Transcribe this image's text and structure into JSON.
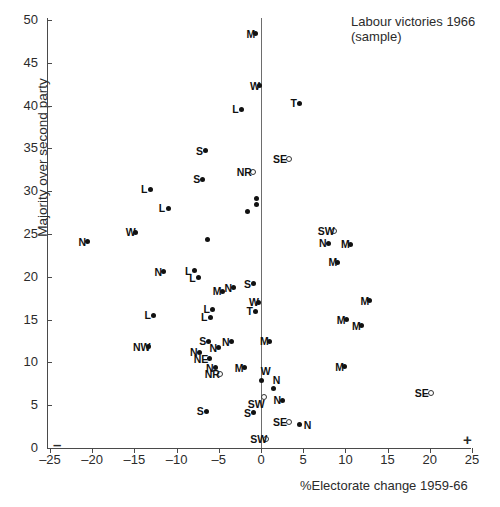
{
  "title": "Figure 8.2  Labour victories at the 1966 General Election",
  "legend": [
    "Labour victories 1966",
    "(sample)"
  ],
  "axes": {
    "ylabel": "Majority over second party",
    "xlabel": "%Electorate change 1959-66",
    "yticks": [
      0,
      5,
      10,
      15,
      20,
      25,
      30,
      35,
      40,
      45,
      50
    ],
    "xticks": [
      -25,
      -20,
      -15,
      -10,
      -5,
      0,
      5,
      10,
      15,
      20,
      25
    ],
    "xtick_labels": [
      "–25",
      "–20",
      "–15",
      "–10",
      "–5",
      "0",
      "5",
      "10",
      "15",
      "20",
      "25"
    ],
    "xlim": [
      -25,
      25
    ],
    "ylim": [
      0,
      50
    ],
    "negative_sign": "–",
    "positive_sign": "+",
    "grid": false
  },
  "chart_data": {
    "type": "scatter",
    "title": "Figure 8.2  Labour victories at the 1966 General Election",
    "xlabel": "%Electorate change 1959-66",
    "ylabel": "Majority over second party",
    "xlim": [
      -25,
      25
    ],
    "ylim": [
      0,
      50
    ],
    "grid": false,
    "legend": [
      "Labour victories 1966 (sample)"
    ],
    "legend_position": "top-right",
    "marker_styles": {
      "filled": "solid black dot",
      "open": "hollow circle"
    },
    "points": [
      {
        "label": "M",
        "x": -0.6,
        "y": 48.4,
        "marker": "filled",
        "label_pos": "left"
      },
      {
        "label": "W",
        "x": -0.2,
        "y": 42.3,
        "marker": "filled",
        "label_pos": "left"
      },
      {
        "label": "T",
        "x": 4.6,
        "y": 40.3,
        "marker": "filled",
        "label_pos": "left"
      },
      {
        "label": "L",
        "x": -2.3,
        "y": 39.6,
        "marker": "filled",
        "label_pos": "left"
      },
      {
        "label": "S",
        "x": -6.6,
        "y": 34.7,
        "marker": "filled",
        "label_pos": "left"
      },
      {
        "label": "SE",
        "x": 3.3,
        "y": 33.8,
        "marker": "open",
        "label_pos": "left"
      },
      {
        "label": "NR",
        "x": -1.0,
        "y": 32.3,
        "marker": "open",
        "label_pos": "left"
      },
      {
        "label": "S",
        "x": -6.9,
        "y": 31.4,
        "marker": "filled",
        "label_pos": "left"
      },
      {
        "label": "L",
        "x": -13.1,
        "y": 30.2,
        "marker": "filled",
        "label_pos": "left"
      },
      {
        "label": "",
        "x": -0.5,
        "y": 29.1,
        "marker": "filled",
        "label_pos": "none"
      },
      {
        "label": "",
        "x": -0.5,
        "y": 28.4,
        "marker": "filled",
        "label_pos": "none"
      },
      {
        "label": "L",
        "x": -11.0,
        "y": 28.0,
        "marker": "filled",
        "label_pos": "left"
      },
      {
        "label": "",
        "x": -1.6,
        "y": 27.6,
        "marker": "filled",
        "label_pos": "none"
      },
      {
        "label": "SW",
        "x": 8.6,
        "y": 25.3,
        "marker": "open",
        "label_pos": "left"
      },
      {
        "label": "W",
        "x": -14.9,
        "y": 25.2,
        "marker": "filled",
        "label_pos": "left"
      },
      {
        "label": "N",
        "x": -20.5,
        "y": 24.1,
        "marker": "filled",
        "label_pos": "left"
      },
      {
        "label": "N",
        "x": 8.0,
        "y": 23.9,
        "marker": "filled",
        "label_pos": "left"
      },
      {
        "label": "M",
        "x": 10.6,
        "y": 23.8,
        "marker": "filled",
        "label_pos": "left"
      },
      {
        "label": "",
        "x": -6.3,
        "y": 24.4,
        "marker": "filled",
        "label_pos": "none"
      },
      {
        "label": "M",
        "x": 9.1,
        "y": 21.7,
        "marker": "filled",
        "label_pos": "left"
      },
      {
        "label": "N",
        "x": -11.5,
        "y": 20.6,
        "marker": "filled",
        "label_pos": "left"
      },
      {
        "label": "L",
        "x": -7.9,
        "y": 20.7,
        "marker": "filled",
        "label_pos": "left"
      },
      {
        "label": "L",
        "x": -7.4,
        "y": 19.9,
        "marker": "filled",
        "label_pos": "left"
      },
      {
        "label": "S",
        "x": -0.9,
        "y": 19.2,
        "marker": "filled",
        "label_pos": "left"
      },
      {
        "label": "N",
        "x": -3.2,
        "y": 18.7,
        "marker": "filled",
        "label_pos": "left"
      },
      {
        "label": "M",
        "x": -4.6,
        "y": 18.3,
        "marker": "filled",
        "label_pos": "left"
      },
      {
        "label": "W",
        "x": -0.3,
        "y": 17.0,
        "marker": "filled",
        "label_pos": "left"
      },
      {
        "label": "M",
        "x": 12.9,
        "y": 17.2,
        "marker": "filled",
        "label_pos": "left"
      },
      {
        "label": "T",
        "x": -0.6,
        "y": 16.0,
        "marker": "filled",
        "label_pos": "left"
      },
      {
        "label": "L",
        "x": -5.7,
        "y": 16.2,
        "marker": "filled",
        "label_pos": "left"
      },
      {
        "label": "L",
        "x": -6.0,
        "y": 15.3,
        "marker": "filled",
        "label_pos": "left"
      },
      {
        "label": "L",
        "x": -12.7,
        "y": 15.5,
        "marker": "filled",
        "label_pos": "left"
      },
      {
        "label": "M",
        "x": 10.1,
        "y": 15.0,
        "marker": "filled",
        "label_pos": "left"
      },
      {
        "label": "M",
        "x": 11.9,
        "y": 14.3,
        "marker": "filled",
        "label_pos": "left"
      },
      {
        "label": "M",
        "x": 1.0,
        "y": 12.5,
        "marker": "filled",
        "label_pos": "left"
      },
      {
        "label": "S",
        "x": -6.2,
        "y": 12.5,
        "marker": "filled",
        "label_pos": "left"
      },
      {
        "label": "N",
        "x": -3.5,
        "y": 12.4,
        "marker": "filled",
        "label_pos": "left"
      },
      {
        "label": "NW",
        "x": -13.3,
        "y": 11.8,
        "marker": "filled",
        "label_pos": "left"
      },
      {
        "label": "N",
        "x": -5.0,
        "y": 11.7,
        "marker": "filled",
        "label_pos": "left"
      },
      {
        "label": "N",
        "x": -7.3,
        "y": 11.2,
        "marker": "filled",
        "label_pos": "left"
      },
      {
        "label": "NE",
        "x": -6.1,
        "y": 10.4,
        "marker": "filled",
        "label_pos": "left"
      },
      {
        "label": "M",
        "x": 9.9,
        "y": 9.5,
        "marker": "filled",
        "label_pos": "left"
      },
      {
        "label": "M",
        "x": -2.0,
        "y": 9.4,
        "marker": "filled",
        "label_pos": "left"
      },
      {
        "label": "N",
        "x": -5.4,
        "y": 9.4,
        "marker": "filled",
        "label_pos": "left"
      },
      {
        "label": "NR",
        "x": -4.8,
        "y": 8.6,
        "marker": "open",
        "label_pos": "left"
      },
      {
        "label": "W",
        "x": 0.1,
        "y": 7.9,
        "marker": "filled",
        "label_pos": "above"
      },
      {
        "label": "N",
        "x": 1.5,
        "y": 6.9,
        "marker": "filled",
        "label_pos": "above"
      },
      {
        "label": "SW",
        "x": 0.3,
        "y": 6.0,
        "marker": "open",
        "label_pos": "below"
      },
      {
        "label": "N",
        "x": 2.6,
        "y": 5.6,
        "marker": "filled",
        "label_pos": "left"
      },
      {
        "label": "SE",
        "x": 20.1,
        "y": 6.4,
        "marker": "open",
        "label_pos": "left"
      },
      {
        "label": "S",
        "x": -6.5,
        "y": 4.3,
        "marker": "filled",
        "label_pos": "left"
      },
      {
        "label": "S",
        "x": -0.9,
        "y": 4.1,
        "marker": "filled",
        "label_pos": "left"
      },
      {
        "label": "SE",
        "x": 3.3,
        "y": 3.0,
        "marker": "open",
        "label_pos": "left"
      },
      {
        "label": "N",
        "x": 4.6,
        "y": 2.7,
        "marker": "filled",
        "label_pos": "right"
      },
      {
        "label": "SW",
        "x": 0.6,
        "y": 1.0,
        "marker": "open",
        "label_pos": "left"
      }
    ]
  }
}
